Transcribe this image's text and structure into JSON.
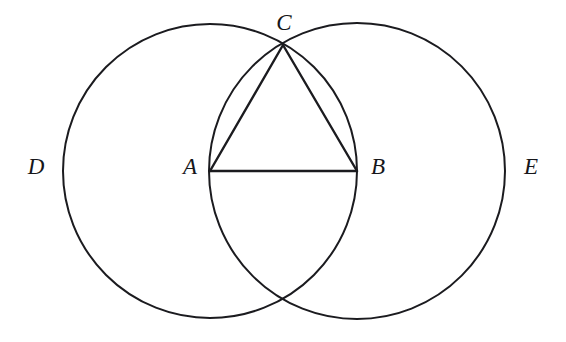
{
  "figure": {
    "kind": "geometric-construction",
    "width": 566,
    "height": 342,
    "background_color": "#ffffff",
    "stroke_color": "#1b1b1f",
    "label_color": "#16161a"
  },
  "labels": {
    "a": "A",
    "b": "B",
    "c": "C",
    "d": "D",
    "e": "E"
  },
  "label_positions": {
    "a": {
      "x": 190,
      "y": 166
    },
    "b": {
      "x": 378,
      "y": 166
    },
    "c": {
      "x": 284,
      "y": 22
    },
    "d": {
      "x": 36,
      "y": 166
    },
    "e": {
      "x": 531,
      "y": 166
    }
  },
  "chart_data": {
    "type": "scatter",
    "title": "",
    "xlabel": "",
    "ylabel": "",
    "grid": false,
    "legend": "none",
    "xlim": [
      0,
      566
    ],
    "ylim": [
      342,
      0
    ],
    "points": [
      {
        "name": "A",
        "label": "A",
        "x": 210,
        "y": 171,
        "role": "center-of-circle-D"
      },
      {
        "name": "B",
        "label": "B",
        "x": 357,
        "y": 171,
        "role": "center-of-circle-E"
      },
      {
        "name": "C",
        "label": "C",
        "x": 283,
        "y": 45,
        "role": "upper-intersection-of-circles"
      },
      {
        "name": "F",
        "label": "",
        "x": 283,
        "y": 299,
        "role": "lower-intersection-of-circles"
      }
    ],
    "circles": [
      {
        "name": "D",
        "label": "D",
        "cx": 210,
        "cy": 171,
        "r": 147
      },
      {
        "name": "E",
        "label": "E",
        "cx": 357,
        "cy": 171,
        "r": 148
      }
    ],
    "segments": [
      {
        "name": "AB",
        "from": "A",
        "to": "B",
        "x1": 210,
        "y1": 171,
        "x2": 357,
        "y2": 171
      },
      {
        "name": "AC",
        "from": "A",
        "to": "C",
        "x1": 210,
        "y1": 171,
        "x2": 283,
        "y2": 45
      },
      {
        "name": "BC",
        "from": "B",
        "to": "C",
        "x1": 357,
        "y1": 171,
        "x2": 283,
        "y2": 45
      }
    ]
  }
}
